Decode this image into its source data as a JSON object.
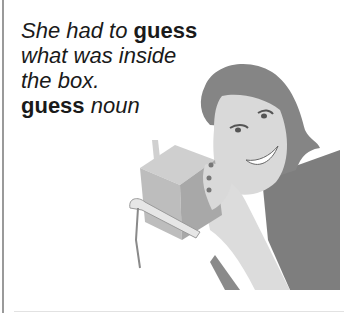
{
  "caption": {
    "sentence_part1": "She had to ",
    "sentence_keyword": "guess",
    "sentence_line2": "what was inside",
    "sentence_line3": "the box.",
    "headword": "guess",
    "part_of_speech": "noun"
  },
  "illustration": {
    "subject": "woman holding a box to her ear, smiling",
    "colors": {
      "hair": "#858585",
      "skin": "#d9d9d9",
      "box_front": "#bdbdbd",
      "box_side": "#a8a8a8",
      "box_top": "#cfcfcf",
      "ribbon": "#e6e6e6",
      "clothing": "#7e7e7e",
      "border": "#9a9a9a"
    }
  }
}
